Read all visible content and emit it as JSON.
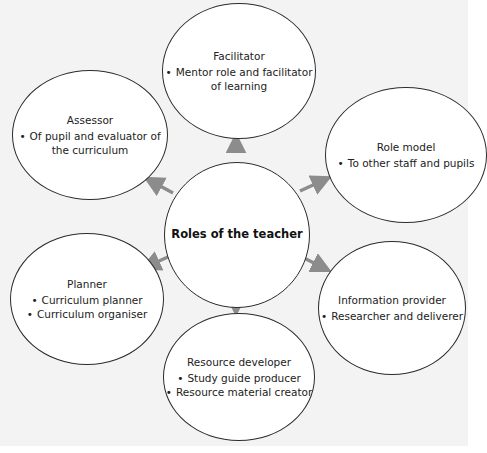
{
  "diagram": {
    "type": "hub-and-spoke",
    "colors": {
      "background": "#f3f3f3",
      "node_fill": "#ffffff",
      "node_border": "#2b2b2b",
      "arrow": "#8c8c8c"
    },
    "center": {
      "title": "Roles of the teacher"
    },
    "nodes": [
      {
        "id": "facilitator",
        "title": "Facilitator",
        "bullets": [
          "Mentor role and facilitator",
          "of learning"
        ]
      },
      {
        "id": "assessor",
        "title": "Assessor",
        "bullets": [
          "Of pupil and evaluator of",
          "the curriculum"
        ]
      },
      {
        "id": "role-model",
        "title": "Role model",
        "bullets": [
          "To other staff and pupils"
        ]
      },
      {
        "id": "planner",
        "title": "Planner",
        "bullets": [
          "Curriculum planner",
          "Curriculum organiser"
        ]
      },
      {
        "id": "information-provider",
        "title": "Information provider",
        "bullets": [
          "Researcher and deliverer"
        ]
      },
      {
        "id": "resource-developer",
        "title": "Resource developer",
        "bullets": [
          "Study guide producer",
          "Resource material creator"
        ]
      }
    ],
    "bullet_glyph": "•",
    "edges": [
      {
        "from": "center",
        "to": "facilitator"
      },
      {
        "from": "center",
        "to": "assessor"
      },
      {
        "from": "center",
        "to": "role-model"
      },
      {
        "from": "center",
        "to": "planner"
      },
      {
        "from": "center",
        "to": "information-provider"
      },
      {
        "from": "center",
        "to": "resource-developer"
      }
    ]
  }
}
